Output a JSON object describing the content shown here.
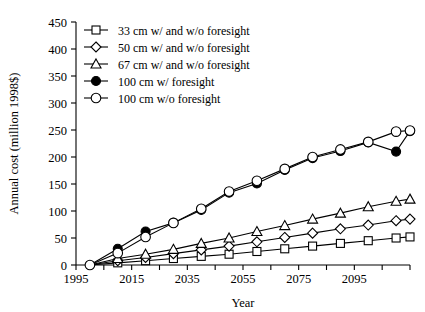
{
  "chart_data": {
    "type": "line",
    "title": "",
    "xlabel": "Year",
    "ylabel": "Annual cost (million 1998$)",
    "xlim": [
      1995,
      2115
    ],
    "ylim": [
      0,
      450
    ],
    "xticks": [
      1995,
      2005,
      2015,
      2025,
      2035,
      2045,
      2055,
      2065,
      2075,
      2085,
      2095,
      2105,
      2115
    ],
    "xticklabels": [
      "1995",
      "",
      "2015",
      "",
      "2035",
      "",
      "2055",
      "",
      "2075",
      "",
      "2095",
      "",
      ""
    ],
    "yticks": [
      0,
      50,
      100,
      150,
      200,
      250,
      300,
      350,
      400,
      450
    ],
    "yticklabels": [
      "0",
      "50",
      "100",
      "150",
      "200",
      "250",
      "300",
      "350",
      "400",
      "450"
    ],
    "grid": false,
    "legend_position": "top-left",
    "x": [
      2000,
      2010,
      2020,
      2030,
      2040,
      2050,
      2060,
      2070,
      2080,
      2090,
      2100,
      2110,
      2115
    ],
    "series": [
      {
        "name": "33 cm w/ and w/o foresight",
        "marker": "square-open",
        "values": [
          0,
          4,
          8,
          12,
          16,
          20,
          25,
          30,
          35,
          40,
          45,
          50,
          52
        ]
      },
      {
        "name": "50 cm w/ and w/o foresight",
        "marker": "diamond-open",
        "values": [
          0,
          8,
          14,
          21,
          28,
          35,
          43,
          51,
          59,
          67,
          74,
          82,
          85
        ]
      },
      {
        "name": "67 cm w/ and w/o foresight",
        "marker": "triangle-open",
        "values": [
          0,
          12,
          20,
          29,
          40,
          50,
          62,
          73,
          85,
          96,
          108,
          118,
          122
        ]
      },
      {
        "name": "100 cm w/ foresight",
        "marker": "circle-filled",
        "values": [
          0,
          30,
          62,
          78,
          102,
          134,
          151,
          176,
          198,
          211,
          227,
          210,
          248
        ]
      },
      {
        "name": "100 cm w/o foresight",
        "marker": "circle-open",
        "values": [
          0,
          22,
          52,
          78,
          104,
          136,
          156,
          178,
          200,
          214,
          228,
          247,
          249
        ]
      }
    ],
    "legend_entries": [
      "33 cm w/ and w/o foresight",
      "50 cm w/ and w/o foresight",
      "67 cm w/ and w/o foresight",
      "100 cm w/ foresight",
      "100 cm w/o foresight"
    ]
  }
}
